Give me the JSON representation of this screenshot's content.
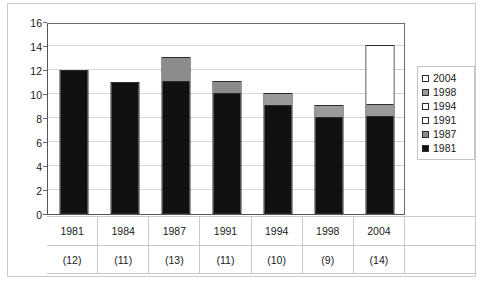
{
  "chart_data": {
    "type": "bar",
    "stacked": true,
    "title": "",
    "xlabel": "",
    "ylabel": "",
    "ylim": [
      0,
      16
    ],
    "ytick_values": [
      0,
      2,
      4,
      6,
      8,
      10,
      12,
      14,
      16
    ],
    "ytick_labels": [
      "0",
      "2",
      "4",
      "6",
      "8",
      "10",
      "12",
      "14",
      "16"
    ],
    "grid": true,
    "legend_position": "right",
    "categories": [
      "1981",
      "1984",
      "1987",
      "1991",
      "1994",
      "1998",
      "2004"
    ],
    "category_sublabels": [
      "(12)",
      "(11)",
      "(13)",
      "(11)",
      "(10)",
      "(9)",
      "(14)"
    ],
    "category_totals": [
      12,
      11,
      13,
      11,
      10,
      9,
      14
    ],
    "series": [
      {
        "name": "1981",
        "color": "#111111",
        "values": [
          12,
          11,
          11.1,
          10.1,
          9.1,
          8.1,
          8.1
        ]
      },
      {
        "name": "1987",
        "color": "#8c8c8c",
        "values": [
          0,
          0,
          2,
          1,
          0,
          0,
          0
        ]
      },
      {
        "name": "1991",
        "color": "#ffffff",
        "values": [
          0,
          0,
          0,
          0,
          0,
          0,
          0
        ]
      },
      {
        "name": "1994",
        "color": "#ffffff",
        "values": [
          0,
          0,
          0,
          0,
          0,
          0,
          0
        ]
      },
      {
        "name": "1998",
        "color": "#9a9a9a",
        "values": [
          0,
          0,
          0,
          0,
          1,
          1,
          1
        ]
      },
      {
        "name": "2004",
        "color": "#ffffff",
        "values": [
          0,
          0,
          0,
          0,
          0,
          0,
          5
        ]
      }
    ],
    "legend": [
      {
        "label": "2004",
        "color": "#ffffff"
      },
      {
        "label": "1998",
        "color": "#9a9a9a"
      },
      {
        "label": "1994",
        "color": "#ffffff"
      },
      {
        "label": "1991",
        "color": "#ffffff"
      },
      {
        "label": "1987",
        "color": "#8c8c8c"
      },
      {
        "label": "1981",
        "color": "#111111"
      }
    ],
    "bars": [
      {
        "category": "1981",
        "sublabel": "(12)",
        "segments": [
          {
            "series": "1981",
            "from": 0,
            "to": 12,
            "color": "#111111"
          }
        ]
      },
      {
        "category": "1984",
        "sublabel": "(11)",
        "segments": [
          {
            "series": "1981",
            "from": 0,
            "to": 11,
            "color": "#111111"
          }
        ]
      },
      {
        "category": "1987",
        "sublabel": "(13)",
        "segments": [
          {
            "series": "1981",
            "from": 0,
            "to": 11.1,
            "color": "#111111"
          },
          {
            "series": "1987",
            "from": 11.1,
            "to": 13.1,
            "color": "#8c8c8c"
          }
        ]
      },
      {
        "category": "1991",
        "sublabel": "(11)",
        "segments": [
          {
            "series": "1981",
            "from": 0,
            "to": 10.1,
            "color": "#111111"
          },
          {
            "series": "1987",
            "from": 10.1,
            "to": 11.1,
            "color": "#8c8c8c"
          }
        ]
      },
      {
        "category": "1994",
        "sublabel": "(10)",
        "segments": [
          {
            "series": "1981",
            "from": 0,
            "to": 9.1,
            "color": "#111111"
          },
          {
            "series": "1998",
            "from": 9.1,
            "to": 10.1,
            "color": "#9a9a9a"
          }
        ]
      },
      {
        "category": "1998",
        "sublabel": "(9)",
        "segments": [
          {
            "series": "1981",
            "from": 0,
            "to": 8.1,
            "color": "#111111"
          },
          {
            "series": "1998",
            "from": 8.1,
            "to": 9.1,
            "color": "#9a9a9a"
          }
        ]
      },
      {
        "category": "2004",
        "sublabel": "(14)",
        "segments": [
          {
            "series": "1981",
            "from": 0,
            "to": 8.1,
            "color": "#111111"
          },
          {
            "series": "1998",
            "from": 8.1,
            "to": 9.1,
            "color": "#9a9a9a"
          },
          {
            "series": "2004",
            "from": 9.1,
            "to": 14.1,
            "color": "#ffffff"
          }
        ]
      }
    ]
  },
  "colors": {
    "black_fill": "#111111",
    "gray_fill": "#8c8c8c",
    "gray_fill_light": "#9a9a9a",
    "white_fill": "#ffffff",
    "gridline": "#d7d7d7",
    "axis": "#555555",
    "frame": "#c9c9c9"
  }
}
